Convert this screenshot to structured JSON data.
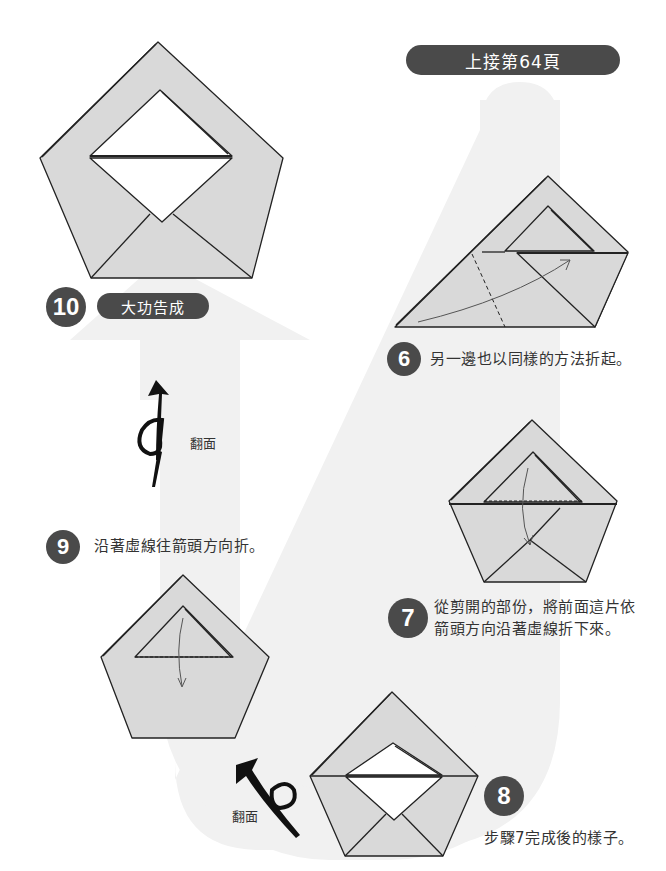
{
  "header": {
    "continued_from": "上接第64頁"
  },
  "steps": [
    {
      "number": "6",
      "text": "另一邊也以同樣的方法折起。"
    },
    {
      "number": "7",
      "text_line1": "從剪開的部份，將前面這片依",
      "text_line2": "箭頭方向沿著虛線折下來。"
    },
    {
      "number": "8",
      "text": "步驟7完成後的樣子。"
    },
    {
      "number": "9",
      "text": "沿著虛線往箭頭方向折。"
    },
    {
      "number": "10",
      "text": "大功告成"
    }
  ],
  "flip_labels": {
    "upper": "翻面",
    "lower": "翻面"
  },
  "icons": {
    "flip": "turn-over-arrow-icon",
    "fold": "curved-fold-arrow-icon"
  },
  "colors": {
    "paper": "#d9d9d9",
    "badge": "#4a4a4a",
    "flow_band": "#f0f0f0",
    "line": "#222222"
  }
}
